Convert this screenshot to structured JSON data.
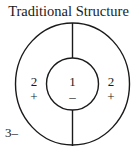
{
  "title": "Traditional Structure",
  "diagram": {
    "outer_ring": {
      "left_label": "2",
      "left_sign": "+",
      "right_label": "2",
      "right_sign": "+"
    },
    "inner_circle": {
      "label": "1",
      "sign": "–"
    },
    "outside_label": "3–"
  }
}
